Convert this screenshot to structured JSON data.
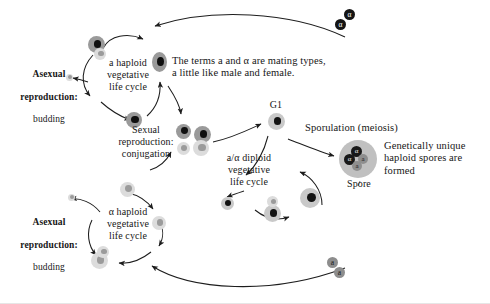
{
  "figure": {
    "background_color": "#ffffff",
    "width": 490,
    "height": 304
  },
  "labels": {
    "asexual_top": {
      "bold_line1": "Asexual",
      "bold_line2": "reproduction:",
      "plain_line": "budding"
    },
    "asexual_bottom": {
      "bold_line1": "Asexual",
      "bold_line2": "reproduction:",
      "plain_line": "budding"
    },
    "a_haploid_cycle": "a haploid\nvegetative\nlife cycle",
    "alpha_haploid_cycle": "α haploid\nvegetative\nlife cycle",
    "mating_types_note": "The terms a and α are mating types,\na little like male and female.",
    "sexual_reproduction": "Sexual\nreproduction:\nconjugation",
    "diploid_cycle": "a/α diploid\nvegetative\nlife cycle",
    "g1": "G1",
    "sporulation": "Sporulation (meiosis)",
    "spore": "Spore",
    "spores_note": "Genetically unique\nhaploid spores are\nformed"
  },
  "spore_sac": {
    "label": "Spore",
    "contents": [
      {
        "mating_type": "α",
        "shade": "dark"
      },
      {
        "mating_type": "α",
        "shade": "dark"
      },
      {
        "mating_type": "a",
        "shade": "gray"
      },
      {
        "mating_type": "a",
        "shade": "gray"
      }
    ]
  },
  "free_spores": {
    "top_right": [
      {
        "mating_type": "α",
        "shade": "dark"
      },
      {
        "mating_type": "α",
        "shade": "dark"
      }
    ],
    "bottom_right": [
      {
        "mating_type": "a",
        "shade": "gray"
      },
      {
        "mating_type": "a",
        "shade": "gray"
      }
    ]
  },
  "colors": {
    "cell_a_body": "#9a9a9a",
    "cell_a_nucleus": "#101010",
    "cell_alpha_body": "#dcdcdc",
    "cell_alpha_nucleus": "#9b9b9b",
    "cell_diploid_body": "#c9c9c9",
    "spore_sac": "#c0c0c0",
    "arrow": "#1d1d1d",
    "text": "#161616"
  }
}
